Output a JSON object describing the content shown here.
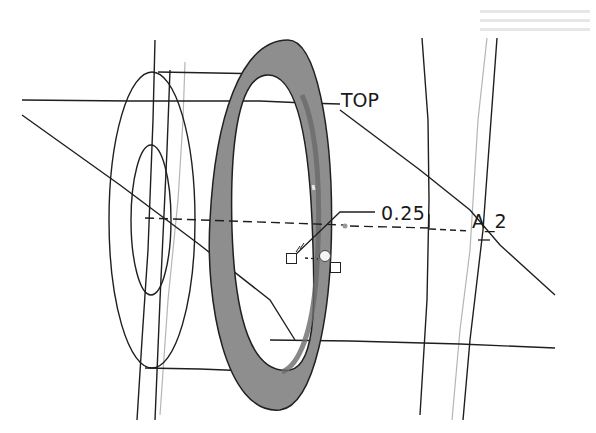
{
  "viewport": {
    "type": "3d-cad-model-view",
    "background": "#ffffff"
  },
  "labels": {
    "datum_plane": "TOP",
    "dimension_value": "0.25",
    "axis_name": "A_2"
  },
  "model": {
    "ring_fill": "#8c8c8c",
    "ring_edge": "#222222",
    "line_color": "#1a1a1a",
    "hidden_line_color": "#b0b0b0"
  },
  "handles": {
    "drag_handle_count": 2,
    "pivot_handle_count": 1
  }
}
